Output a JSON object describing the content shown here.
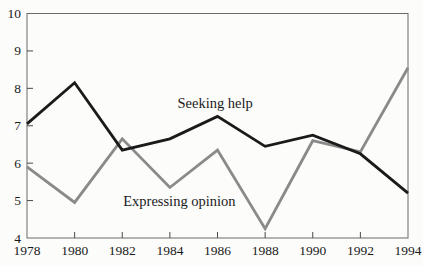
{
  "chart_data": {
    "type": "line",
    "x": [
      1978,
      1980,
      1982,
      1984,
      1986,
      1988,
      1990,
      1992,
      1994
    ],
    "series": [
      {
        "name": "Seeking help",
        "color": "#1a1a1a",
        "stroke_width": 2.8,
        "values": [
          7.05,
          8.15,
          6.35,
          6.65,
          7.25,
          6.45,
          6.75,
          6.25,
          5.2
        ]
      },
      {
        "name": "Expressing opinion",
        "color": "#8a8a8a",
        "stroke_width": 2.8,
        "values": [
          5.9,
          4.95,
          6.65,
          5.35,
          6.35,
          4.25,
          6.6,
          6.3,
          8.55
        ]
      }
    ],
    "title": "",
    "xlabel": "",
    "ylabel": "",
    "xlim": [
      1978,
      1994
    ],
    "ylim": [
      4,
      10
    ],
    "yticks": [
      4,
      5,
      6,
      7,
      8,
      9,
      10
    ],
    "ytick_labels": [
      "4",
      "5",
      "6",
      "7",
      "8",
      "9",
      "10"
    ],
    "xticks": [
      1978,
      1980,
      1982,
      1984,
      1986,
      1988,
      1990,
      1992,
      1994
    ],
    "xtick_labels": [
      "1978",
      "1980",
      "1982",
      "1984",
      "1986",
      "1988",
      "1990",
      "1992",
      "1994"
    ],
    "grid": false,
    "legend_position": "inline-annotations",
    "annotations": [
      {
        "text": "Seeking help",
        "x": 1985.9,
        "y": 7.6
      },
      {
        "text": "Expressing opinion",
        "x": 1984.4,
        "y": 5.0
      }
    ],
    "frame_color": "#6a6a6a",
    "axis_color": "#4a4a4a",
    "background": "#fcfcfa"
  }
}
